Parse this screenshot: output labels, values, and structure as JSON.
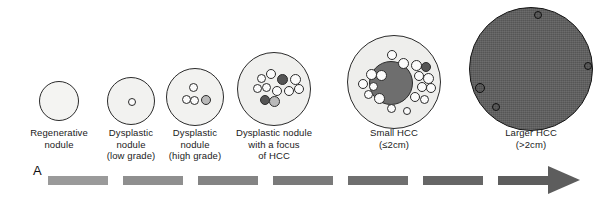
{
  "figure": {
    "panel_letter": "A",
    "background_color": "#ffffff",
    "outline_color": "#2b2b2b",
    "nodule_fill_light": "#f2f2f0",
    "nodule_fill_light2": "#eceeec",
    "tumor_fill_dark": "#6e6e6e",
    "tumor_fill_darkest": "#4b4b4b",
    "cell_fill_light": "#fbfbfb",
    "cell_fill_mid": "#b9b9b9",
    "cell_fill_dark": "#555555"
  },
  "stages": [
    {
      "id": "regenerative-nodule",
      "caption": "Regenerative\nnodule",
      "caption_lines": [
        "Regenerative",
        "nodule"
      ],
      "cx": 59,
      "cy": 101,
      "r": 20,
      "fill": "#f4f4f2",
      "internal_cells": 0,
      "has_tumor_mass": false,
      "caption_x": 9,
      "caption_y": 127,
      "caption_w": 100
    },
    {
      "id": "dysplastic-nodule-low-grade",
      "caption": "Dysplastic\nnodule\n(low grade)",
      "caption_lines": [
        "Dysplastic",
        "nodule",
        "(low grade)"
      ],
      "cx": 131,
      "cy": 101,
      "r": 24,
      "fill": "#f2f2f0",
      "internal_cells": 1,
      "has_tumor_mass": false,
      "caption_x": 83,
      "caption_y": 127,
      "caption_w": 96
    },
    {
      "id": "dysplastic-nodule-high-grade",
      "caption": "Dysplastic\nnodule\n(high grade)",
      "caption_lines": [
        "Dysplastic",
        "nodule",
        "(high grade)"
      ],
      "cx": 195,
      "cy": 97,
      "r": 29,
      "fill": "#f2f2f0",
      "internal_cells": 4,
      "has_tumor_mass": false,
      "caption_x": 146,
      "caption_y": 127,
      "caption_w": 98
    },
    {
      "id": "dysplastic-nodule-with-focus-of-hcc",
      "caption": "Dysplastic nodule\nwith a focus\nof HCC",
      "caption_lines": [
        "Dysplastic nodule",
        "with a focus",
        "of HCC"
      ],
      "cx": 274,
      "cy": 89,
      "r": 37,
      "fill": "#f0f0ee",
      "internal_cells": 11,
      "has_tumor_mass": false,
      "caption_x": 221,
      "caption_y": 127,
      "caption_w": 106
    },
    {
      "id": "small-hcc",
      "caption": "Small HCC\n(≤2cm)",
      "caption_lines": [
        "Small HCC",
        "(≤2cm)"
      ],
      "cx": 394,
      "cy": 82,
      "r": 47,
      "fill": "#eeeeec",
      "internal_cells": 18,
      "has_tumor_mass": true,
      "tumor_r": 22,
      "caption_x": 344,
      "caption_y": 127,
      "caption_w": 100
    },
    {
      "id": "larger-hcc",
      "caption": "Larger HCC\n(>2cm)",
      "caption_lines": [
        "Larger HCC",
        "(>2cm)"
      ],
      "cx": 531,
      "cy": 69,
      "r": 62,
      "fill": "#5f5f5f",
      "internal_cells": 4,
      "has_tumor_mass": false,
      "caption_x": 481,
      "caption_y": 127,
      "caption_w": 100
    }
  ],
  "progression_arrow": {
    "label": "progression-arrow",
    "segments": [
      {
        "x": 48,
        "y": 176,
        "w": 60,
        "color": "#9a9a9a"
      },
      {
        "x": 123,
        "y": 176,
        "w": 60,
        "color": "#8f8f8f"
      },
      {
        "x": 198,
        "y": 176,
        "w": 60,
        "color": "#848484"
      },
      {
        "x": 273,
        "y": 176,
        "w": 60,
        "color": "#7a7a7a"
      },
      {
        "x": 348,
        "y": 176,
        "w": 60,
        "color": "#6f6f6f"
      },
      {
        "x": 423,
        "y": 176,
        "w": 60,
        "color": "#666666"
      },
      {
        "x": 498,
        "y": 176,
        "w": 52,
        "color": "#5d5d5d"
      }
    ],
    "head": {
      "x": 548,
      "y": 166,
      "w": 32,
      "h": 29,
      "color": "#5d5d5d"
    }
  },
  "cell_layouts": {
    "dysplastic-nodule-low-grade": [
      {
        "dx": 0,
        "dy": 0,
        "r": 4,
        "tone": "light"
      }
    ],
    "dysplastic-nodule-high-grade": [
      {
        "dx": -3,
        "dy": -11,
        "r": 4.5,
        "tone": "light"
      },
      {
        "dx": -10,
        "dy": 1,
        "r": 4.5,
        "tone": "light"
      },
      {
        "dx": -2,
        "dy": 2,
        "r": 4.5,
        "tone": "light"
      },
      {
        "dx": 10,
        "dy": 2,
        "r": 5,
        "tone": "half"
      }
    ],
    "dysplastic-nodule-with-focus-of-hcc": [
      {
        "dx": -14,
        "dy": -12,
        "r": 4.5,
        "tone": "light"
      },
      {
        "dx": -4,
        "dy": -16,
        "r": 5,
        "tone": "light"
      },
      {
        "dx": 7,
        "dy": -11,
        "r": 5.5,
        "tone": "dark"
      },
      {
        "dx": 20,
        "dy": -11,
        "r": 5.5,
        "tone": "light"
      },
      {
        "dx": -18,
        "dy": -2,
        "r": 4.5,
        "tone": "light"
      },
      {
        "dx": -9,
        "dy": -3,
        "r": 4.5,
        "tone": "light"
      },
      {
        "dx": 2,
        "dy": 1,
        "r": 5,
        "tone": "light"
      },
      {
        "dx": 14,
        "dy": 1,
        "r": 5,
        "tone": "light"
      },
      {
        "dx": 24,
        "dy": -1,
        "r": 5,
        "tone": "light"
      },
      {
        "dx": -10,
        "dy": 10,
        "r": 5,
        "tone": "dark"
      },
      {
        "dx": -1,
        "dy": 11,
        "r": 5.5,
        "tone": "half"
      }
    ],
    "small-hcc": [
      {
        "dx": -3,
        "dy": -28,
        "r": 5,
        "tone": "light"
      },
      {
        "dx": 8,
        "dy": -20,
        "r": 5.5,
        "tone": "light"
      },
      {
        "dx": 21,
        "dy": -18,
        "r": 5.5,
        "tone": "light"
      },
      {
        "dx": 31,
        "dy": -16,
        "r": 5,
        "tone": "dark"
      },
      {
        "dx": -24,
        "dy": -9,
        "r": 5.5,
        "tone": "light"
      },
      {
        "dx": -14,
        "dy": -8,
        "r": 5.5,
        "tone": "light"
      },
      {
        "dx": 24,
        "dy": -7,
        "r": 5,
        "tone": "light"
      },
      {
        "dx": 33,
        "dy": -5,
        "r": 5.5,
        "tone": "light"
      },
      {
        "dx": -32,
        "dy": 1,
        "r": 5,
        "tone": "light"
      },
      {
        "dx": -22,
        "dy": 3,
        "r": 4.5,
        "tone": "light"
      },
      {
        "dx": 27,
        "dy": 4,
        "r": 5,
        "tone": "light"
      },
      {
        "dx": 36,
        "dy": 5,
        "r": 5,
        "tone": "light"
      },
      {
        "dx": -27,
        "dy": 11,
        "r": 4.5,
        "tone": "light"
      },
      {
        "dx": -16,
        "dy": 15,
        "r": 5.5,
        "tone": "light"
      },
      {
        "dx": 20,
        "dy": 14,
        "r": 5,
        "tone": "light"
      },
      {
        "dx": 29,
        "dy": 16,
        "r": 4.5,
        "tone": "light"
      },
      {
        "dx": -4,
        "dy": 25,
        "r": 4.5,
        "tone": "light"
      },
      {
        "dx": 12,
        "dy": 28,
        "r": 4,
        "tone": "light"
      }
    ],
    "larger-hcc": [
      {
        "dx": 6,
        "dy": -55,
        "r": 4,
        "tone": "ring"
      },
      {
        "dx": 56,
        "dy": -4,
        "r": 4,
        "tone": "ring"
      },
      {
        "dx": -52,
        "dy": 18,
        "r": 5,
        "tone": "ring"
      },
      {
        "dx": -36,
        "dy": 37,
        "r": 4,
        "tone": "ring"
      }
    ]
  }
}
